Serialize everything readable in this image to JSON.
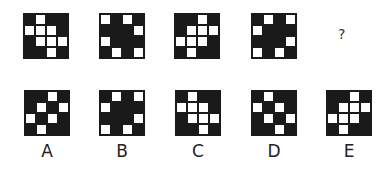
{
  "question": {
    "sequence": [
      {
        "rows": [
          "BWBB",
          "WWWB",
          "BWWW",
          "BBWB"
        ]
      },
      {
        "rows": [
          "WBWB",
          "BBBW",
          "WBBB",
          "BWBW"
        ]
      },
      {
        "rows": [
          "BBWB",
          "BWWW",
          "WWWB",
          "BWBB"
        ]
      },
      {
        "rows": [
          "BWBW",
          "WBBB",
          "BBBW",
          "WBWB"
        ]
      }
    ],
    "missing_marker": "?"
  },
  "options": [
    {
      "label": "A",
      "rows": [
        "BBWB",
        "BWBW",
        "WBWB",
        "BWBB"
      ]
    },
    {
      "label": "B",
      "rows": [
        "BWBW",
        "WBBB",
        "BBBW",
        "WBWB"
      ]
    },
    {
      "label": "C",
      "rows": [
        "BWBB",
        "WWWB",
        "BWWW",
        "BBWB"
      ]
    },
    {
      "label": "D",
      "rows": [
        "BWBB",
        "WBWB",
        "BWBW",
        "BBWB"
      ]
    },
    {
      "label": "E",
      "rows": [
        "BBWB",
        "BWWW",
        "WWWB",
        "BWBB"
      ]
    }
  ],
  "colors": {
    "black": "#1a1a1a",
    "white": "#ffffff"
  }
}
